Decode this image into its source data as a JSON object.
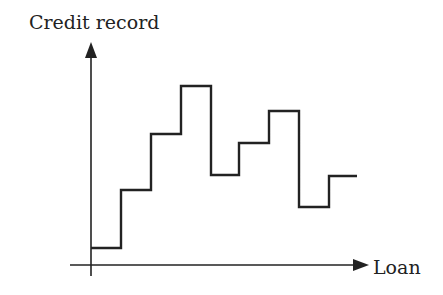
{
  "chart_data": {
    "type": "line",
    "subtype": "step",
    "title": "",
    "xlabel": "Loan",
    "ylabel": "Credit record",
    "grid": false,
    "legend": null,
    "ticks": {
      "x": [],
      "y": []
    },
    "series": [
      {
        "name": "Credit record",
        "color": "#222222",
        "points": [
          {
            "x": 0,
            "y": 0.08
          },
          {
            "x": 30,
            "y": 0.34
          },
          {
            "x": 60,
            "y": 0.59
          },
          {
            "x": 90,
            "y": 0.81
          },
          {
            "x": 120,
            "y": 0.41
          },
          {
            "x": 148,
            "y": 0.55
          },
          {
            "x": 178,
            "y": 0.7
          },
          {
            "x": 208,
            "y": 0.26
          },
          {
            "x": 238,
            "y": 0.4
          },
          {
            "x": 266,
            "y": 0.4
          }
        ]
      }
    ],
    "pixel_geometry": {
      "origin": [
        91,
        265
      ],
      "y_axis_top": 42,
      "x_axis_left": 70,
      "x_axis_right": 368,
      "step_x": [
        91,
        121,
        151,
        181,
        211,
        239,
        269,
        299,
        329,
        357
      ],
      "step_y": [
        248,
        190,
        134,
        86,
        175,
        143,
        111,
        207,
        176
      ]
    }
  },
  "labels": {
    "y_axis": "Credit record",
    "x_axis": "Loan"
  },
  "colors": {
    "line": "#222222",
    "axis": "#222222",
    "background": "#ffffff"
  }
}
